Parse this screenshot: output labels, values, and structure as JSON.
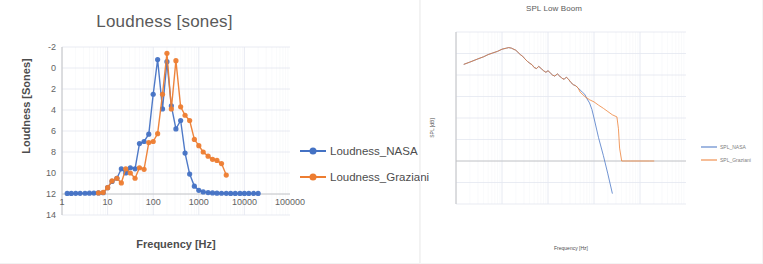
{
  "page": {
    "background": "#ffffff"
  },
  "colors": {
    "nasa": "#4472C4",
    "graziani": "#ED7D31",
    "grid": "#E4E8F0",
    "axis": "#C9C9C9",
    "text": "#595959"
  },
  "charts": [
    {
      "id": "loudness-chart",
      "title": "Loudness [sones]",
      "xlabel": "Frequency [Hz]",
      "ylabel": "Loudness [Sones]",
      "xticks": [
        "1",
        "10",
        "100",
        "1000",
        "10000",
        "100000"
      ],
      "yticks": [
        "14",
        "12",
        "10",
        "8",
        "6",
        "4",
        "2",
        "0",
        "-2"
      ],
      "legend": [
        {
          "label": "Loudness_NASA",
          "color": "#4472C4",
          "marker": true
        },
        {
          "label": "Loudness_Graziani",
          "color": "#ED7D31",
          "marker": true
        }
      ]
    },
    {
      "id": "spl-chart",
      "title": "SPL Low Boom",
      "xlabel": "Frequency [Hz]",
      "ylabel": "SPL [dB]",
      "xticks": [
        "1",
        "10",
        "100",
        "1000",
        "10000",
        "100000"
      ],
      "yticks": [
        "120",
        "100",
        "80",
        "60",
        "40",
        "20",
        "0",
        "-20",
        "-40"
      ],
      "legend": [
        {
          "label": "SPL_NASA",
          "color": "#4472C4",
          "marker": false
        },
        {
          "label": "SPL_Graziani",
          "color": "#ED7D31",
          "marker": false
        }
      ]
    }
  ],
  "chart_data": [
    {
      "type": "scatter",
      "id": "loudness-chart",
      "title": "Loudness [sones]",
      "xlabel": "Frequency [Hz]",
      "ylabel": "Loudness [Sones]",
      "xscale": "log",
      "xlim": [
        1,
        100000
      ],
      "ylim": [
        -2,
        14
      ],
      "xticks": [
        1,
        10,
        100,
        1000,
        10000,
        100000
      ],
      "yticks": [
        -2,
        0,
        2,
        4,
        6,
        8,
        10,
        12,
        14
      ],
      "grid": true,
      "legend_position": "right",
      "series": [
        {
          "name": "Loudness_NASA",
          "color": "#4472C4",
          "marker": "circle",
          "x": [
            1.3,
            1.6,
            2,
            2.5,
            3.2,
            4,
            5,
            6.3,
            8,
            10,
            12.5,
            16,
            20,
            25,
            31.5,
            40,
            50,
            63,
            80,
            100,
            125,
            160,
            200,
            250,
            315,
            400,
            500,
            630,
            800,
            1000,
            1250,
            1600,
            2000,
            2500,
            3150,
            4000,
            5000,
            6300,
            8000,
            10000,
            12500,
            16000,
            20000
          ],
          "y": [
            0.05,
            0.05,
            0.06,
            0.06,
            0.07,
            0.08,
            0.09,
            0.1,
            0.12,
            0.6,
            1.2,
            1.5,
            2.4,
            2.0,
            2.5,
            2.4,
            4.8,
            5.0,
            5.7,
            9.5,
            12.8,
            8.1,
            12.6,
            8.4,
            6.2,
            7.0,
            3.9,
            1.9,
            0.75,
            0.35,
            0.2,
            0.14,
            0.1,
            0.08,
            0.07,
            0.06,
            0.05,
            0.05,
            0.05,
            0.05,
            0.05,
            0.05,
            0.05
          ]
        },
        {
          "name": "Loudness_Graziani",
          "color": "#ED7D31",
          "marker": "circle",
          "x": [
            6.3,
            8,
            10,
            12.5,
            16,
            20,
            25,
            31.5,
            40,
            50,
            63,
            80,
            100,
            125,
            160,
            200,
            250,
            315,
            400,
            500,
            630,
            800,
            1000,
            1250,
            1600,
            2000,
            2500,
            3150,
            4000
          ],
          "y": [
            0.1,
            0.15,
            0.6,
            1.25,
            1.5,
            1.05,
            2.4,
            2.0,
            1.5,
            2.5,
            2.35,
            4.9,
            5.0,
            5.75,
            9.5,
            13.4,
            8.1,
            12.7,
            8.3,
            7.5,
            7.0,
            5.2,
            4.6,
            4.0,
            3.6,
            3.3,
            3.2,
            2.9,
            1.8
          ]
        }
      ]
    },
    {
      "type": "line",
      "id": "spl-chart",
      "title": "SPL Low Boom",
      "xlabel": "Frequency [Hz]",
      "ylabel": "SPL [dB]",
      "xscale": "log",
      "xlim": [
        1,
        100000
      ],
      "ylim": [
        -40,
        120
      ],
      "xticks": [
        1,
        10,
        100,
        1000,
        10000,
        100000
      ],
      "yticks": [
        -40,
        -20,
        0,
        20,
        40,
        60,
        80,
        100,
        120
      ],
      "grid": true,
      "legend_position": "right",
      "series": [
        {
          "name": "SPL_NASA",
          "color": "#4472C4",
          "marker": "none",
          "x": [
            1.5,
            2,
            3,
            4,
            5,
            6.3,
            8,
            10,
            12.5,
            14,
            16,
            20,
            25,
            28,
            31.5,
            36,
            40,
            45,
            50,
            56,
            63,
            71,
            80,
            90,
            100,
            112,
            125,
            140,
            160,
            180,
            200,
            225,
            250,
            280,
            315,
            355,
            400,
            450,
            500,
            560,
            630,
            700,
            800,
            900,
            1000,
            1250,
            1600,
            2000,
            2500
          ],
          "y": [
            90,
            92,
            95,
            97,
            99,
            100.5,
            102,
            104,
            105,
            105.5,
            105,
            103,
            99,
            97.5,
            95,
            92.5,
            91,
            89.5,
            87,
            86,
            88,
            86,
            84,
            82.5,
            84,
            82,
            80,
            79,
            81,
            79,
            77,
            76,
            78,
            76,
            73,
            71,
            70,
            68,
            66,
            64,
            62,
            58,
            54,
            48,
            40,
            22,
            5,
            -12,
            -30
          ]
        },
        {
          "name": "SPL_Graziani",
          "color": "#ED7D31",
          "marker": "none",
          "x": [
            1.5,
            2,
            3,
            4,
            5,
            6.3,
            8,
            10,
            12.5,
            14,
            16,
            20,
            25,
            28,
            31.5,
            36,
            40,
            45,
            50,
            56,
            63,
            71,
            80,
            90,
            100,
            112,
            125,
            140,
            160,
            180,
            200,
            225,
            250,
            280,
            315,
            355,
            400,
            450,
            500,
            630,
            800,
            1000,
            1250,
            1600,
            2000,
            2500,
            3150,
            3400,
            3600,
            4000,
            6300,
            10000,
            16000,
            20000
          ],
          "y": [
            90,
            92,
            95,
            97,
            99,
            100.5,
            102,
            104,
            105,
            105.5,
            105,
            103,
            99,
            97.5,
            95,
            92.5,
            91,
            89.5,
            87,
            86,
            88,
            86,
            84,
            82.5,
            84,
            82,
            80,
            79,
            81,
            79,
            77,
            76,
            78,
            76,
            73,
            71,
            70,
            68,
            64,
            60,
            57,
            55,
            52,
            49,
            46,
            43,
            41,
            30,
            12,
            0,
            0,
            0,
            0,
            0
          ]
        }
      ]
    }
  ]
}
